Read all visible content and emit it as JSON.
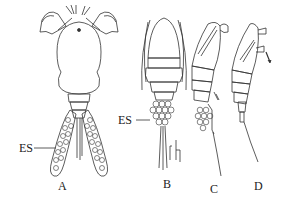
{
  "figure": {
    "panels": [
      {
        "id": "A",
        "label": "A",
        "annotation": "ES"
      },
      {
        "id": "B",
        "label": "B",
        "annotation": "ES"
      },
      {
        "id": "C",
        "label": "C"
      },
      {
        "id": "D",
        "label": "D"
      }
    ],
    "stroke_color": "#333333",
    "background": "#ffffff"
  }
}
